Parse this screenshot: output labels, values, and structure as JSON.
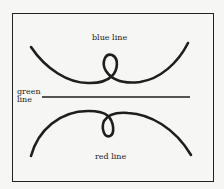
{
  "diagram": {
    "labels": {
      "blue": "blue line",
      "green_line1": "green",
      "green_line2": "line",
      "red": "red line"
    },
    "curves": [
      {
        "name": "blue line",
        "shape": "U-shaped curve opening upward with a small loop at its center"
      },
      {
        "name": "green line",
        "shape": "straight horizontal line"
      },
      {
        "name": "red line",
        "shape": "arch-shaped curve opening downward with a small loop at its center"
      }
    ],
    "stroke_color": "#1e1e1e",
    "background_color": "#f6f6f4"
  }
}
